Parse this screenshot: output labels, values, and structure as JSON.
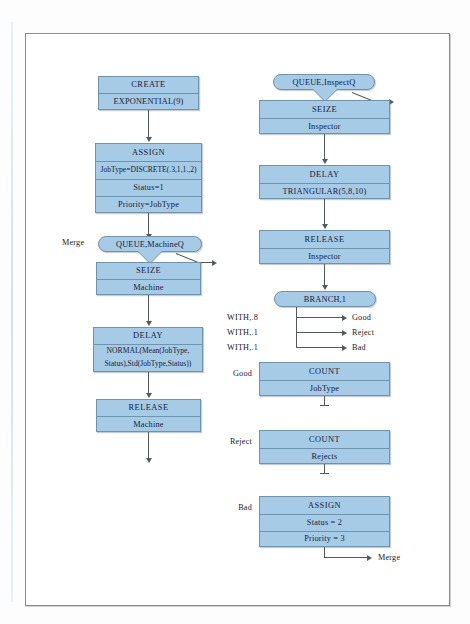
{
  "diagram": {
    "colors": {
      "block_fill": "#a6cbe6",
      "block_border": "#6f93ad",
      "connector": "#55585c",
      "frame": "#8a8a8a"
    },
    "left_column": {
      "create": {
        "title": "CREATE",
        "rows": [
          "EXPONENTIAL(9)"
        ]
      },
      "assign": {
        "title": "ASSIGN",
        "rows": [
          "JobType=DISCRETE(.3,1,1.,2)",
          "Status=1",
          "Priority=JobType"
        ]
      },
      "queue": {
        "label": "QUEUE,MachineQ",
        "merge_label": "Merge"
      },
      "seize": {
        "title": "SEIZE",
        "rows": [
          "Machine"
        ]
      },
      "delay": {
        "title": "DELAY",
        "rows": [
          "NORMAL(Mean(JobType,",
          "Status),Std(JobType,Status))"
        ]
      },
      "release": {
        "title": "RELEASE",
        "rows": [
          "Machine"
        ]
      }
    },
    "right_column": {
      "queue": {
        "label": "QUEUE,InspectQ"
      },
      "seize": {
        "title": "SEIZE",
        "rows": [
          "Inspector"
        ]
      },
      "delay": {
        "title": "DELAY",
        "rows": [
          "TRIANGULAR(5,8,10)"
        ]
      },
      "release": {
        "title": "RELEASE",
        "rows": [
          "Inspector"
        ]
      },
      "branch": {
        "label": "BRANCH,1",
        "conditions": [
          {
            "with": "WITH,.8",
            "target": "Good"
          },
          {
            "with": "WITH,.1",
            "target": "Reject"
          },
          {
            "with": "WITH,.1",
            "target": "Bad"
          }
        ]
      },
      "count_good": {
        "entry_label": "Good",
        "title": "COUNT",
        "rows": [
          "JobType"
        ]
      },
      "count_reject": {
        "entry_label": "Reject",
        "title": "COUNT",
        "rows": [
          "Rejects"
        ]
      },
      "assign_bad": {
        "entry_label": "Bad",
        "title": "ASSIGN",
        "rows": [
          "Status = 2",
          "Priority = 3"
        ],
        "exit_label": "Merge"
      }
    }
  }
}
